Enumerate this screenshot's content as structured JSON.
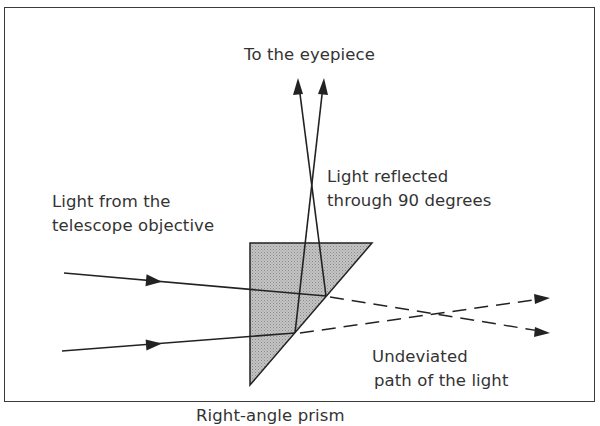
{
  "diagram": {
    "labels": {
      "eyepiece": "To the eyepiece",
      "reflected_line1": "Light reflected",
      "reflected_line2": "through 90 degrees",
      "objective_line1": "Light from the",
      "objective_line2": "telescope objective",
      "undeviated_line1": "Undeviated",
      "undeviated_line2": "path of the light",
      "prism": "Right-angle prism"
    },
    "colors": {
      "line": "#222222",
      "prism_fill": "#b8b8b8",
      "text": "#333333",
      "frame": "#3a3a3a"
    }
  }
}
